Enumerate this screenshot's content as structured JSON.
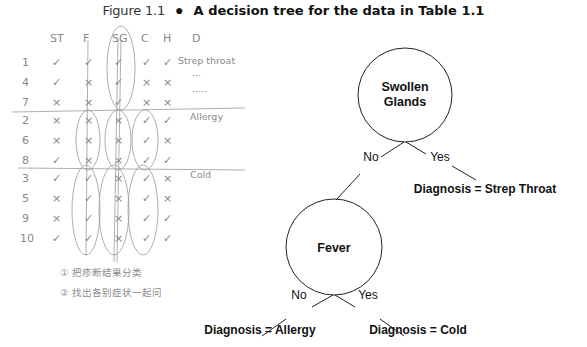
{
  "caption": {
    "figure_label": "Figure 1.1",
    "bullet": "●",
    "title": "A decision tree for the data in Table 1.1"
  },
  "tree": {
    "root": {
      "label_line1": "Swollen",
      "label_line2": "Glands"
    },
    "root_edges": {
      "no": "No",
      "yes": "Yes"
    },
    "leaf_strep": "Diagnosis = Strep Throat",
    "fever": {
      "label": "Fever"
    },
    "fever_edges": {
      "no": "No",
      "yes": "Yes"
    },
    "leaf_allergy": "Diagnosis = Allergy",
    "leaf_cold": "Diagnosis = Cold"
  },
  "handwritten": {
    "headers": [
      "ST",
      "F",
      "SG",
      "C",
      "H",
      "D"
    ],
    "rows": [
      {
        "id": "1",
        "cells": [
          "✓",
          "✓",
          "✓",
          "✓",
          "✓"
        ],
        "diagnosis": "Strep throat"
      },
      {
        "id": "4",
        "cells": [
          "✓",
          "×",
          "✓",
          "×",
          "×"
        ],
        "diagnosis": "..."
      },
      {
        "id": "7",
        "cells": [
          "×",
          "×",
          "✓",
          "×",
          "×"
        ],
        "diagnosis": "....."
      },
      {
        "id": "2",
        "cells": [
          "×",
          "×",
          "×",
          "✓",
          "✓"
        ],
        "diagnosis": "Allergy"
      },
      {
        "id": "6",
        "cells": [
          "×",
          "×",
          "×",
          "✓",
          "×"
        ],
        "diagnosis": ""
      },
      {
        "id": "8",
        "cells": [
          "✓",
          "×",
          "×",
          "✓",
          "✓"
        ],
        "diagnosis": ""
      },
      {
        "id": "3",
        "cells": [
          "✓",
          "✓",
          "×",
          "✓",
          "×"
        ],
        "diagnosis": "Cold"
      },
      {
        "id": "5",
        "cells": [
          "×",
          "✓",
          "×",
          "✓",
          "×"
        ],
        "diagnosis": ""
      },
      {
        "id": "9",
        "cells": [
          "×",
          "✓",
          "×",
          "✓",
          "✓"
        ],
        "diagnosis": ""
      },
      {
        "id": "10",
        "cells": [
          "✓",
          "✓",
          "×",
          "✓",
          "✓"
        ],
        "diagnosis": ""
      }
    ],
    "notes": [
      "① 把疹断结果分类",
      "② 找出各别症状一起问"
    ]
  }
}
